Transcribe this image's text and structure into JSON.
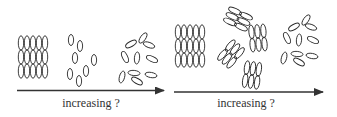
{
  "diagram": {
    "colors": {
      "stroke": "#2a2a2a",
      "arrow": "#333333",
      "text": "#333333",
      "background": "#ffffff"
    },
    "panels": [
      {
        "id": "left",
        "stages": [
          "crystal",
          "aligned-scattered",
          "isotropic"
        ],
        "arrow_label": "increasing ?"
      },
      {
        "id": "right",
        "stages": [
          "crystal",
          "clustered-layers",
          "isotropic"
        ],
        "arrow_label": "increasing ?"
      }
    ]
  }
}
